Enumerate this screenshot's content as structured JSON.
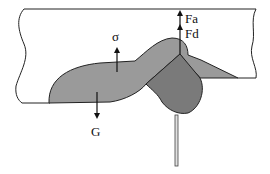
{
  "diagram": {
    "labels": {
      "fa": "Fa",
      "fd": "Fd",
      "sigma": "σ",
      "g": "G"
    },
    "colors": {
      "background": "#ffffff",
      "outline": "#222222",
      "melt_pool_light": "#9a9a9a",
      "melt_pool_dark": "#7a7a7a",
      "wire": "#d8d8d8"
    }
  }
}
